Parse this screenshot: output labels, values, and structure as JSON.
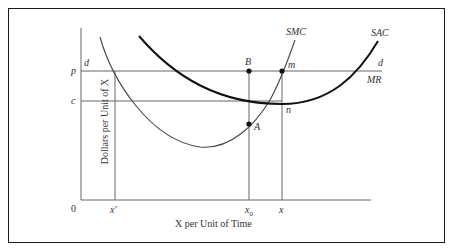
{
  "diagram": {
    "type": "economics-cost-curves",
    "axes": {
      "y_label": "Dollars per Unit of X",
      "x_label": "X per Unit of Time",
      "origin": "0"
    },
    "price_levels": {
      "p": "p",
      "c": "c"
    },
    "quantities": {
      "x_prime": "x′",
      "x0": "x",
      "x0_sub": "0",
      "x": "x"
    },
    "curves": {
      "smc": "SMC",
      "sac": "SAC",
      "demand_left": "d",
      "demand_right": "d",
      "mr": "MR"
    },
    "points": {
      "B": "B",
      "m": "m",
      "A": "A",
      "n": "n"
    },
    "colors": {
      "line": "#555555",
      "thick_curve": "#111111",
      "text": "#333333"
    }
  }
}
